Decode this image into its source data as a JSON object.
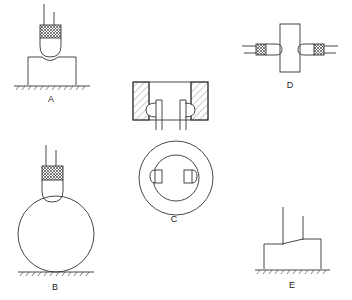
{
  "figures": [
    {
      "id": "A",
      "label": "A",
      "description": "probe on flat block"
    },
    {
      "id": "B",
      "label": "B",
      "description": "probe on sphere"
    },
    {
      "id": "C",
      "label": "C",
      "description": "two probes inside ring, section and plan"
    },
    {
      "id": "D",
      "label": "D",
      "description": "two opposed probes on block sides"
    },
    {
      "id": "E",
      "label": "E",
      "description": "wire contact on block top"
    }
  ],
  "colors": {
    "line": "#333333",
    "background": "#ffffff"
  }
}
